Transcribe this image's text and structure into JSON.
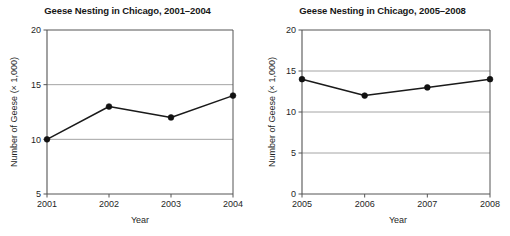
{
  "figure": {
    "background_color": "#ffffff",
    "axis_color": "#555555",
    "grid_color": "#9a9a9a",
    "series_color": "#1a1a1a",
    "marker_color": "#111111"
  },
  "charts": [
    {
      "id": "left",
      "title": "Geese Nesting in Chicago, 2001–2004",
      "xlabel": "Year",
      "ylabel": "Number of Geese (× 1,000)",
      "xticks": [
        "2001",
        "2002",
        "2003",
        "2004"
      ],
      "yticks": [
        "5",
        "10",
        "15",
        "20"
      ]
    },
    {
      "id": "right",
      "title": "Geese Nesting in Chicago, 2005–2008",
      "xlabel": "Year",
      "ylabel": "Number of Geese (× 1,000)",
      "xticks": [
        "2005",
        "2006",
        "2007",
        "2008"
      ],
      "yticks": [
        "0",
        "5",
        "10",
        "15",
        "20"
      ]
    }
  ],
  "chart_data": [
    {
      "type": "line",
      "title": "Geese Nesting in Chicago, 2001–2004",
      "xlabel": "Year",
      "ylabel": "Number of Geese (× 1,000)",
      "categories": [
        "2001",
        "2002",
        "2003",
        "2004"
      ],
      "x": [
        2001,
        2002,
        2003,
        2004
      ],
      "values": [
        10,
        13,
        12,
        14
      ],
      "ylim": [
        5,
        20
      ],
      "yticks": [
        5,
        10,
        15,
        20
      ],
      "xlim": [
        2001,
        2004
      ],
      "grid": "horizontal",
      "legend": null,
      "markers": "filled-circle",
      "units": "thousands of geese"
    },
    {
      "type": "line",
      "title": "Geese Nesting in Chicago, 2005–2008",
      "xlabel": "Year",
      "ylabel": "Number of Geese (× 1,000)",
      "categories": [
        "2005",
        "2006",
        "2007",
        "2008"
      ],
      "x": [
        2005,
        2006,
        2007,
        2008
      ],
      "values": [
        14,
        12,
        13,
        14
      ],
      "ylim": [
        0,
        20
      ],
      "yticks": [
        0,
        5,
        10,
        15,
        20
      ],
      "xlim": [
        2005,
        2008
      ],
      "grid": "horizontal",
      "legend": null,
      "markers": "filled-circle",
      "units": "thousands of geese"
    }
  ]
}
